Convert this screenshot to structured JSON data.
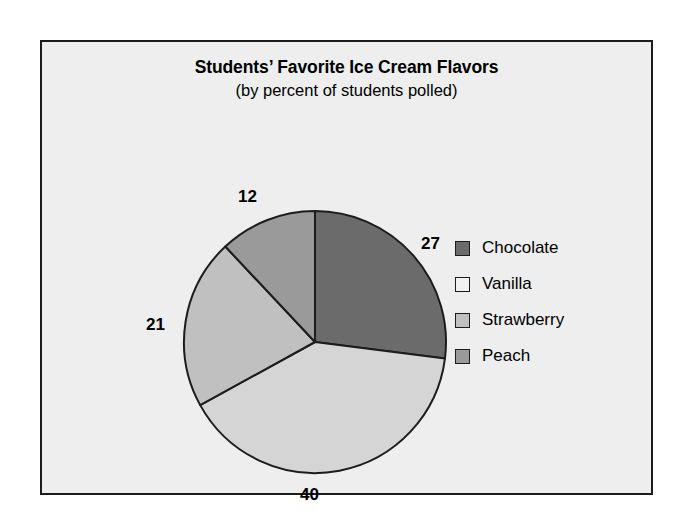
{
  "chart_data": {
    "type": "pie",
    "title": "Students’ Favorite Ice Cream Flavors",
    "subtitle": "(by percent of students polled)",
    "xlabel": "",
    "ylabel": "",
    "legend_position": "right",
    "grid": false,
    "units": "percent of students polled",
    "start_angle_deg": 0,
    "direction": "clockwise",
    "categories": [
      "Chocolate",
      "Vanilla",
      "Strawberry",
      "Peach"
    ],
    "values": [
      27,
      40,
      21,
      12
    ],
    "total": 100,
    "slices": [
      {
        "label": "Chocolate",
        "value": 27,
        "value_text": "27",
        "color": "#6b6b6b",
        "start_deg": 0,
        "end_deg": 97.2,
        "label_x": 379,
        "label_y": 192
      },
      {
        "label": "Vanilla",
        "value": 40,
        "value_text": "40",
        "color": "#d5d5d5",
        "start_deg": 97.2,
        "end_deg": 241.2,
        "label_x": 258,
        "label_y": 443
      },
      {
        "label": "Strawberry",
        "value": 21,
        "value_text": "21",
        "color": "#c0c0c0",
        "start_deg": 241.2,
        "end_deg": 316.8,
        "label_x": 104,
        "label_y": 273
      },
      {
        "label": "Peach",
        "value": 12,
        "value_text": "12",
        "color": "#9a9a9a",
        "start_deg": 316.8,
        "end_deg": 360,
        "label_x": 196,
        "label_y": 145
      }
    ],
    "geometry": {
      "center_x": 273,
      "center_y": 300,
      "radius": 131
    },
    "colors": {
      "outline": "#1c1c1c",
      "background": "#eeeeee",
      "page": "#ffffff",
      "text": "#000000"
    }
  },
  "legend": {
    "items": [
      {
        "label": "Chocolate",
        "color": "#6b6b6b"
      },
      {
        "label": "Vanilla",
        "color": "#f2f2f2"
      },
      {
        "label": "Strawberry",
        "color": "#c0c0c0"
      },
      {
        "label": "Peach",
        "color": "#9a9a9a"
      }
    ]
  }
}
